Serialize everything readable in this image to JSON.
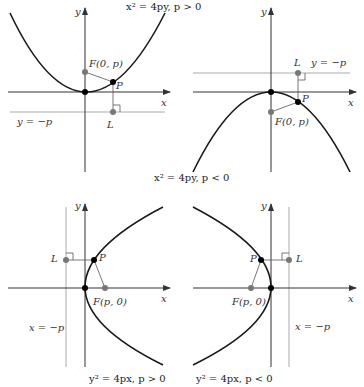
{
  "panels": [
    {
      "id": "top-left",
      "caption": "x² = 4py, p > 0",
      "axis_x": "x",
      "axis_y": "y",
      "focus_label": "F(0, p)",
      "point_label": "P",
      "directrix_point_label": "L",
      "directrix_label": "y = −p"
    },
    {
      "id": "top-right",
      "caption": "x² = 4py, p < 0",
      "axis_x": "x",
      "axis_y": "y",
      "focus_label": "F(0, p)",
      "point_label": "P",
      "directrix_point_label": "L",
      "directrix_label": "y = −p"
    },
    {
      "id": "bottom-left",
      "caption": "y² = 4px, p > 0",
      "axis_x": "x",
      "axis_y": "y",
      "focus_label": "F(p, 0)",
      "point_label": "P",
      "directrix_point_label": "L",
      "directrix_label": "x = −p"
    },
    {
      "id": "bottom-right",
      "caption": "y² = 4px, p < 0",
      "axis_x": "x",
      "axis_y": "y",
      "focus_label": "F(p, 0)",
      "point_label": "P",
      "directrix_point_label": "L",
      "directrix_label": "x = −p"
    }
  ],
  "colors": {
    "curve": "#1a1a1a",
    "axis": "#333333",
    "directrix": "#aaaaaa",
    "focus_point": "#777777",
    "vertex_point": "#000000"
  }
}
